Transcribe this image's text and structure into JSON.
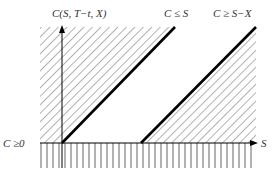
{
  "diagram": {
    "labels": {
      "y_axis": "C(S, T−t, X)",
      "x_axis": "S",
      "upper_bound": "C ≤ S",
      "lower_bound": "C ≥ S−X",
      "nonneg": "C ≥0"
    },
    "colors": {
      "line": "#000000",
      "hatch": "#555555",
      "text": "#333333",
      "background": "#ffffff"
    },
    "geometry": {
      "origin": [
        62,
        143
      ],
      "x_axis_end": 256,
      "y_axis_top": 26,
      "upper_line": [
        [
          62,
          143
        ],
        [
          175,
          27
        ]
      ],
      "lower_line": [
        [
          141,
          143
        ],
        [
          256,
          27
        ]
      ],
      "region_left": 40,
      "region_top": 27,
      "bottom_hatch_end": 168
    }
  }
}
